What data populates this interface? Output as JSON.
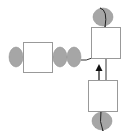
{
  "diagram": {
    "width": 129,
    "height": 134,
    "colors": {
      "background": "#ffffff",
      "node_fill": "#ffffff",
      "node_stroke": "#999999",
      "ellipse_fill": "#a6a6a6",
      "ellipse_stroke": "#8a8a8a",
      "line": "#333333",
      "arrow": "#111111"
    },
    "boxes": [
      {
        "id": "left-box",
        "x": 23,
        "y": 42,
        "w": 29,
        "h": 30
      },
      {
        "id": "top-right-box",
        "x": 91,
        "y": 27,
        "w": 29,
        "h": 31
      },
      {
        "id": "bottom-right-box",
        "x": 88,
        "y": 80,
        "w": 29,
        "h": 31
      }
    ],
    "ellipses": [
      {
        "id": "left-ellipse",
        "cx": 16,
        "cy": 57,
        "rx": 7,
        "ry": 10
      },
      {
        "id": "middle-ellipse-1",
        "cx": 60,
        "cy": 57,
        "rx": 7,
        "ry": 10
      },
      {
        "id": "middle-ellipse-2",
        "cx": 74,
        "cy": 57,
        "rx": 7,
        "ry": 10
      },
      {
        "id": "top-ellipse",
        "cx": 103,
        "cy": 17,
        "rx": 10,
        "ry": 10
      },
      {
        "id": "bottom-ellipse",
        "cx": 102,
        "cy": 121,
        "rx": 10,
        "ry": 10
      }
    ]
  }
}
